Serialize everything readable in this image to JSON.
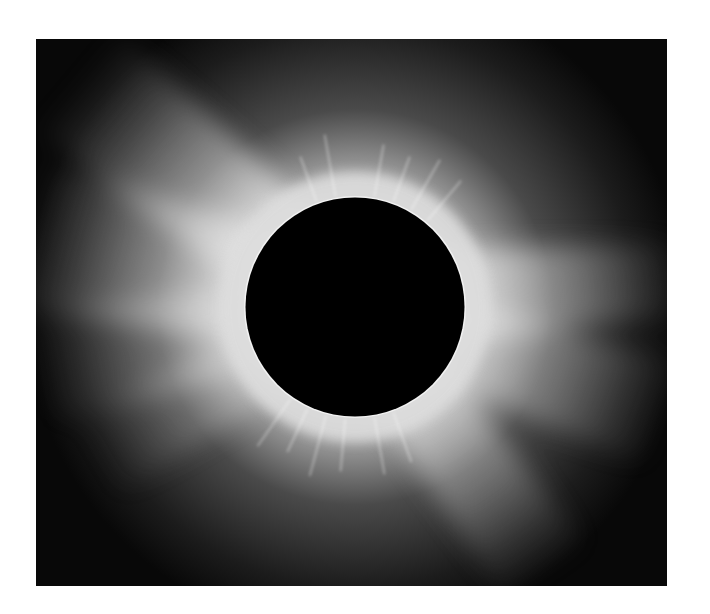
{
  "image": {
    "subject": "Total solar eclipse with corona streamers",
    "colors": {
      "background": "#ffffff",
      "sky": "#0a0a0a",
      "corona": "#e8e8e8",
      "moon": "#000000"
    }
  }
}
